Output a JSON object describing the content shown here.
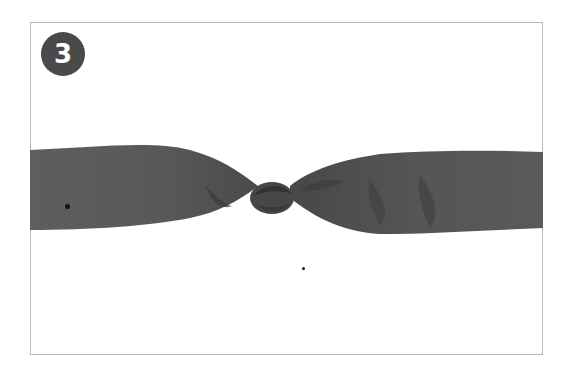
{
  "step": {
    "number": "3"
  },
  "illustration": {
    "subject": "fabric-band-knotted-in-center",
    "fabric_color": "#5c5c5c",
    "fabric_shadow": "#3e3e3e",
    "frame_color": "#b8b8b8"
  },
  "markers": [
    {
      "name": "left-marker-dot",
      "x": 67,
      "y": 206,
      "size": 5
    },
    {
      "name": "lower-marker-dot",
      "x": 303,
      "y": 268,
      "size": 3
    }
  ]
}
